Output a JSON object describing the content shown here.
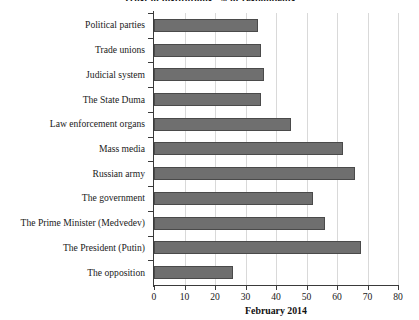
{
  "chart_data": {
    "type": "bar",
    "orientation": "horizontal",
    "title": "Trust in institutions, % of respondents",
    "xlabel": "February 2014",
    "ylabel": "",
    "categories": [
      "Political parties",
      "Trade unions",
      "Judicial system",
      "The State Duma",
      "Law enforcement organs",
      "Mass media",
      "Russian army",
      "The government",
      "The Prime Minister (Medvedev)",
      "The President (Putin)",
      "The opposition"
    ],
    "values": [
      34,
      35,
      36,
      35,
      45,
      62,
      66,
      52,
      56,
      68,
      26
    ],
    "xlim": [
      0,
      80
    ],
    "xticks": [
      0,
      10,
      20,
      30,
      40,
      50,
      60,
      70,
      80
    ],
    "xtick_labels": [
      "0",
      "10",
      "20",
      "30",
      "40",
      "50",
      "60",
      "70",
      "80"
    ],
    "grid": "vertical",
    "legend": null,
    "bar_color": "#6f6f6f",
    "bar_edge_color": "#4a4a4a",
    "grid_color": "#d9d9d9",
    "axis_color": "#3a3a3a"
  }
}
